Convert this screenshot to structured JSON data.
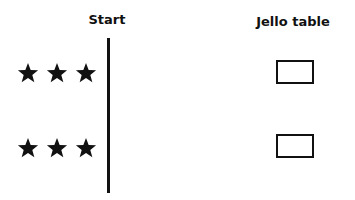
{
  "headers": {
    "start": "Start",
    "jello_table": "Jello table"
  },
  "rows": [
    {
      "stars": 3,
      "box": "empty"
    },
    {
      "stars": 3,
      "box": "empty"
    }
  ],
  "colors": {
    "ink": "#111111",
    "background": "#ffffff"
  }
}
